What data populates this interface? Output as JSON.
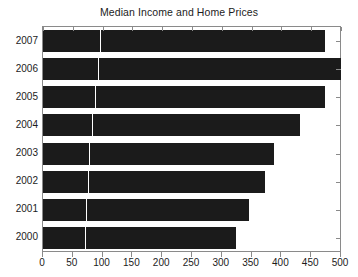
{
  "chart_data": {
    "type": "bar",
    "orientation": "horizontal",
    "title": "Median Income and Home Prices",
    "xlabel": "",
    "ylabel": "",
    "categories": [
      "2007",
      "2006",
      "2005",
      "2004",
      "2003",
      "2002",
      "2001",
      "2000"
    ],
    "values": [
      473,
      500,
      473,
      432,
      388,
      373,
      346,
      323
    ],
    "series": [
      {
        "name": "Median Income",
        "values": [
          95,
          92,
          88,
          82,
          78,
          76,
          72,
          71
        ]
      },
      {
        "name": "Home Prices",
        "values": [
          378,
          408,
          385,
          350,
          310,
          297,
          274,
          252
        ]
      }
    ],
    "stacked": true,
    "xlim": [
      0,
      500
    ],
    "xticks": [
      0,
      50,
      100,
      150,
      200,
      250,
      300,
      350,
      400,
      450,
      500
    ],
    "xticklabels": [
      "0",
      "50",
      "100",
      "150",
      "200",
      "250",
      "300",
      "350",
      "400",
      "450",
      "500"
    ],
    "grid": false,
    "legend": "none",
    "bar_color": "#1b1b1b",
    "frame_color": "#8a8a8a",
    "background": "#ffffff"
  }
}
